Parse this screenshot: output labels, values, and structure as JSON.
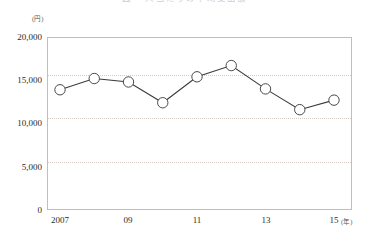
{
  "title": "図  一人当たりの平均支出額",
  "axis": {
    "y_unit": "(円)",
    "x_unit": "(年)",
    "y_ticks": [
      "20,000",
      "15,000",
      "10,000",
      "5,000",
      "0"
    ],
    "x_ticks": [
      "2007",
      "09",
      "11",
      "13",
      "15"
    ]
  },
  "chart_data": {
    "type": "line",
    "title": "図  一人当たりの平均支出額",
    "xlabel": "(年)",
    "ylabel": "(円)",
    "ylim": [
      0,
      20000
    ],
    "yticks": [
      0,
      5000,
      10000,
      15000,
      20000
    ],
    "grid": true,
    "grid_style": "dotted horizontal at 5000/10000/15000",
    "legend": null,
    "marker": "open-circle",
    "x": [
      2007,
      2008,
      2009,
      2010,
      2011,
      2012,
      2013,
      2014,
      2015
    ],
    "xtick_labels": [
      "2007",
      "",
      "09",
      "",
      "11",
      "",
      "13",
      "",
      "15"
    ],
    "categories": [
      "2007",
      "2008",
      "2009",
      "2010",
      "2011",
      "2012",
      "2013",
      "2014",
      "2015"
    ],
    "values": [
      13900,
      15200,
      14800,
      12400,
      15400,
      16700,
      14000,
      11600,
      12700
    ]
  },
  "colors": {
    "line": "#3a3a3a",
    "marker_fill": "#ffffff",
    "marker_stroke": "#4a4a4a",
    "frame": "#bfbfbf",
    "gridline": "#d8c9c1",
    "text": "#2b2b2b"
  }
}
